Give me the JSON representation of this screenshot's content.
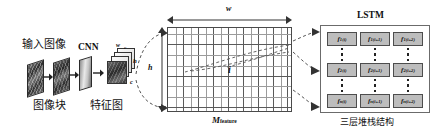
{
  "figure": {
    "type": "architecture-diagram",
    "background": "#ffffff",
    "stroke": "#333333"
  },
  "pipeline": {
    "input_label": "输入图像",
    "cnn_label": "CNN",
    "patch_label": "图像块",
    "featuremap_label": "特征图",
    "cube_dims": {
      "w": "w",
      "h": "h",
      "c": "c"
    }
  },
  "matrix": {
    "label": "M",
    "label_sub": "feature",
    "width_label": "w",
    "height_label": "h",
    "index_label": "i",
    "cols_thick": 8,
    "cols_thin": 16,
    "rows_thick": 6,
    "rows_thin": 9
  },
  "lstm": {
    "title": "LSTM",
    "caption": "三层堆栈结构",
    "cells": [
      [
        {
          "base": "f",
          "sub": "1",
          "sup": "(i)"
        },
        {
          "base": "f",
          "sub": "1",
          "sup": "(i+1)"
        },
        {
          "base": "f",
          "sub": "1",
          "sup": "(i+2)"
        }
      ],
      [
        {
          "base": "f",
          "sub": "2",
          "sup": "(i)"
        },
        {
          "base": "f",
          "sub": "2",
          "sup": "(i+1)"
        },
        {
          "base": "f",
          "sub": "2",
          "sup": "(i+2)"
        }
      ],
      [
        {
          "base": "f",
          "sub": "n",
          "sup": "(i)"
        },
        {
          "base": "f",
          "sub": "n",
          "sup": "(i+1)"
        },
        {
          "base": "f",
          "sub": "n",
          "sup": "(i+2)"
        }
      ]
    ]
  }
}
